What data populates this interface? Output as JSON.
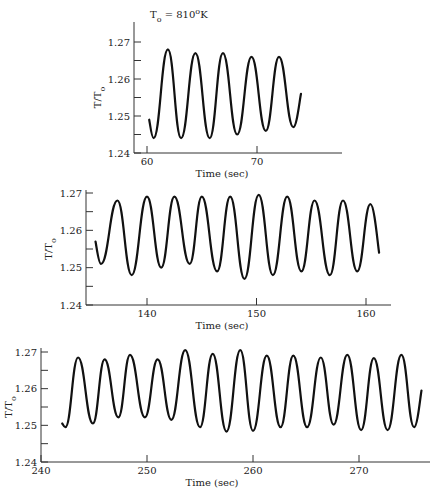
{
  "annotation": {
    "text": "T",
    "sub": "o",
    "rest": " = 810",
    "sup": "o",
    "unit": "K"
  },
  "chart_data": [
    {
      "type": "line",
      "title": "",
      "xlabel": "Time (sec)",
      "ylabel": "T/To",
      "xlim": [
        59,
        77
      ],
      "ylim": [
        1.24,
        1.27
      ],
      "xticks": [
        60,
        70
      ],
      "yticks": [
        1.24,
        1.25,
        1.26,
        1.27
      ],
      "ytick_labels": [
        "1.24",
        "1.25",
        "1.26",
        "1.27"
      ],
      "grid": false,
      "annotation": "To = 810°K",
      "series": [
        {
          "name": "T/To",
          "x": [
            60.2,
            60.6,
            61.9,
            63.1,
            64.4,
            65.7,
            66.9,
            68.2,
            69.5,
            70.8,
            72.0,
            73.3,
            74.0
          ],
          "y": [
            1.249,
            1.244,
            1.268,
            1.244,
            1.267,
            1.244,
            1.267,
            1.245,
            1.266,
            1.246,
            1.266,
            1.247,
            1.256
          ]
        }
      ],
      "frame": {
        "left": 134,
        "right": 342,
        "top": 22,
        "bottom": 153,
        "x0": 60,
        "x0px": 147,
        "pxPerUnit": 11.0,
        "y_top_val": 1.27,
        "y_top_px": 42,
        "y_bot_val": 1.24,
        "y_bot_px": 153
      }
    },
    {
      "type": "line",
      "title": "",
      "xlabel": "Time (sec)",
      "ylabel": "T/To",
      "xlim": [
        135,
        163
      ],
      "ylim": [
        1.24,
        1.27
      ],
      "xticks": [
        140,
        150,
        160
      ],
      "yticks": [
        1.24,
        1.25,
        1.26,
        1.27
      ],
      "ytick_labels": [
        "1.24",
        "1.25",
        "1.26",
        "1.27"
      ],
      "grid": false,
      "series": [
        {
          "name": "T/To",
          "x": [
            135.3,
            135.8,
            137.3,
            138.6,
            140.0,
            141.3,
            142.5,
            143.9,
            145.0,
            146.4,
            147.6,
            148.9,
            150.2,
            151.5,
            152.8,
            154.1,
            155.3,
            156.7,
            157.9,
            159.2,
            160.4,
            161.2
          ],
          "y": [
            1.257,
            1.251,
            1.268,
            1.248,
            1.269,
            1.25,
            1.269,
            1.251,
            1.269,
            1.249,
            1.269,
            1.247,
            1.2695,
            1.248,
            1.269,
            1.249,
            1.268,
            1.248,
            1.268,
            1.249,
            1.267,
            1.254
          ]
        }
      ],
      "frame": {
        "left": 86,
        "right": 391,
        "top": 190,
        "bottom": 305,
        "x0": 140,
        "x0px": 147,
        "pxPerUnit": 10.95,
        "y_top_val": 1.27,
        "y_top_px": 193,
        "y_bot_val": 1.24,
        "y_bot_px": 305
      }
    },
    {
      "type": "line",
      "title": "",
      "xlabel": "Time (sec)",
      "ylabel": "T/To",
      "xlim": [
        240,
        276
      ],
      "ylim": [
        1.24,
        1.27
      ],
      "xticks": [
        240,
        250,
        260,
        270
      ],
      "yticks": [
        1.24,
        1.25,
        1.26,
        1.27
      ],
      "ytick_labels": [
        "1.24",
        "1.25",
        "1.26",
        "1.27"
      ],
      "grid": false,
      "series": [
        {
          "name": "T/To",
          "x": [
            242.0,
            242.3,
            243.5,
            244.9,
            246.0,
            247.3,
            248.4,
            249.8,
            251.0,
            252.3,
            253.6,
            255.0,
            256.2,
            257.5,
            258.8,
            260.0,
            261.3,
            262.6,
            263.8,
            265.1,
            266.4,
            267.6,
            268.9,
            270.2,
            271.4,
            272.7,
            274.0,
            275.2,
            275.9
          ],
          "y": [
            1.2505,
            1.2495,
            1.2685,
            1.2505,
            1.268,
            1.2522,
            1.2692,
            1.2522,
            1.268,
            1.2515,
            1.2705,
            1.2495,
            1.2695,
            1.2483,
            1.2705,
            1.2485,
            1.269,
            1.2495,
            1.269,
            1.2495,
            1.2685,
            1.2502,
            1.2692,
            1.2487,
            1.2683,
            1.2487,
            1.2692,
            1.2495,
            1.2595
          ]
        }
      ],
      "frame": {
        "left": 41,
        "right": 430,
        "top": 348,
        "bottom": 462,
        "x0": 240,
        "x0px": 41,
        "pxPerUnit": 10.6,
        "y_top_val": 1.27,
        "y_top_px": 352,
        "y_bot_val": 1.24,
        "y_bot_px": 462
      }
    }
  ]
}
